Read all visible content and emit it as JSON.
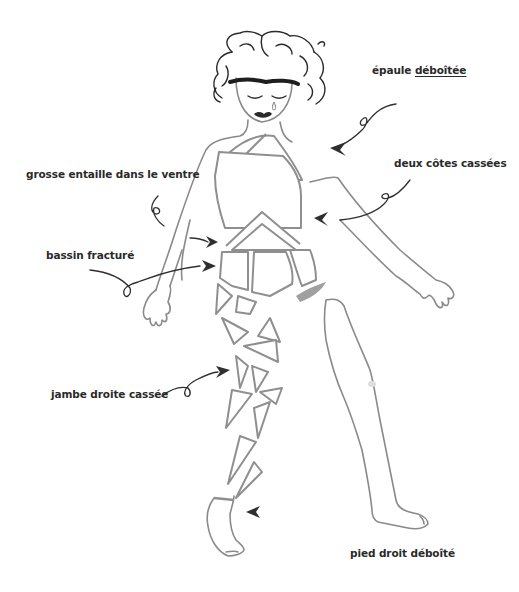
{
  "illustration": {
    "subject": "figure with broken body parts",
    "colors": {
      "ink": "#2f2f2f",
      "outline": "#8a8a8a",
      "background": "#ffffff"
    }
  },
  "labels": {
    "shoulder": {
      "prefix": "épaule ",
      "emphasis": "déboîtée"
    },
    "belly": "grosse entaille dans le ventre",
    "ribs": "deux côtes cassées",
    "pelvis": "bassin fracturé",
    "leg": "jambe droite cassée",
    "foot": "pied droit déboîté"
  }
}
